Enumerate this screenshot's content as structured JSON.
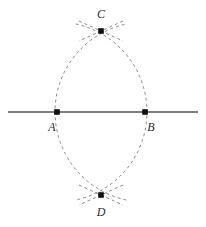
{
  "figure": {
    "canvas": {
      "width": 206,
      "height": 227,
      "background": "#ffffff"
    },
    "style": {
      "line_color": "#555555",
      "arc_color": "#8a8a8a",
      "point_color": "#111111",
      "label_color": "#2b2b2b",
      "line_width": 1.4,
      "arc_width": 1,
      "arc_dash": "3 3",
      "point_size": 4
    },
    "baseline": {
      "name": "line-AB",
      "x1": 8,
      "y1": 112,
      "x2": 198,
      "y2": 112
    },
    "points": [
      {
        "id": "A",
        "label": "A",
        "x": 57,
        "y": 112,
        "label_x": 52,
        "label_y": 127
      },
      {
        "id": "B",
        "label": "B",
        "x": 145,
        "y": 112,
        "label_x": 151,
        "label_y": 127
      },
      {
        "id": "C",
        "label": "C",
        "x": 101,
        "y": 31,
        "label_x": 101,
        "label_y": 14
      },
      {
        "id": "D",
        "label": "D",
        "x": 101,
        "y": 195,
        "label_x": 101,
        "label_y": 212
      }
    ],
    "arcs": [
      {
        "name": "arc-centered-at-A",
        "center_x": 57,
        "center_y": 112,
        "radius": 90,
        "start_angle_deg": -78,
        "end_angle_deg": 78,
        "path": "M 88.5 27.4 A 90 90 0 0 1 88.5 196.6"
      },
      {
        "name": "arc-centered-at-B",
        "center_x": 145,
        "center_y": 112,
        "radius": 90,
        "start_angle_deg": 102,
        "end_angle_deg": 258,
        "path": "M 113.5 27.4 A 90 90 0 0 0 113.5 196.6"
      }
    ],
    "crossings": [
      {
        "name": "crossing-mark-C",
        "at": "C",
        "strokes": [
          {
            "x1": 79,
            "y1": 21,
            "x2": 123,
            "y2": 41
          },
          {
            "x1": 123,
            "y1": 21,
            "x2": 79,
            "y2": 41
          }
        ]
      },
      {
        "name": "crossing-mark-D",
        "at": "D",
        "strokes": [
          {
            "x1": 79,
            "y1": 185,
            "x2": 123,
            "y2": 205
          },
          {
            "x1": 123,
            "y1": 185,
            "x2": 79,
            "y2": 205
          }
        ]
      }
    ]
  }
}
